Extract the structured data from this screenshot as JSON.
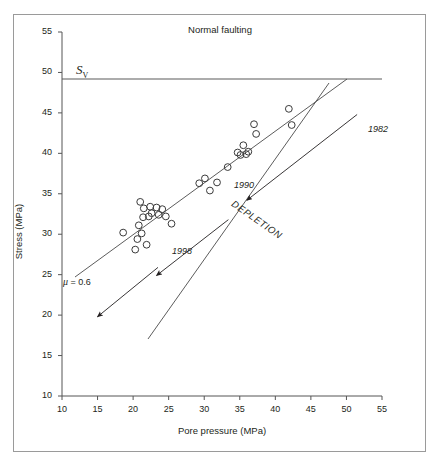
{
  "chart_data": {
    "type": "scatter",
    "title": "Normal faulting",
    "xlabel": "Pore pressure (MPa)",
    "ylabel": "Stress (MPa)",
    "xlim": [
      10,
      55
    ],
    "ylim": [
      10,
      55
    ],
    "xticks": [
      10,
      15,
      20,
      25,
      30,
      35,
      40,
      45,
      50,
      55
    ],
    "yticks": [
      10,
      15,
      20,
      25,
      30,
      35,
      40,
      45,
      50,
      55
    ],
    "grid": false,
    "legend": "none",
    "marker": "open-circle",
    "series": [
      {
        "name": "Stress vs pore pressure",
        "points": [
          [
            18.6,
            30.2
          ],
          [
            20.3,
            28.1
          ],
          [
            20.6,
            29.4
          ],
          [
            20.8,
            31.1
          ],
          [
            21.0,
            34.0
          ],
          [
            21.2,
            30.1
          ],
          [
            21.4,
            32.1
          ],
          [
            21.5,
            33.2
          ],
          [
            21.9,
            28.7
          ],
          [
            22.2,
            32.2
          ],
          [
            22.4,
            33.4
          ],
          [
            22.6,
            32.6
          ],
          [
            23.3,
            33.3
          ],
          [
            23.6,
            32.4
          ],
          [
            24.1,
            33.1
          ],
          [
            24.6,
            32.2
          ],
          [
            25.4,
            31.3
          ],
          [
            29.3,
            36.3
          ],
          [
            30.1,
            36.9
          ],
          [
            30.8,
            35.4
          ],
          [
            31.8,
            36.4
          ],
          [
            33.3,
            38.3
          ],
          [
            34.7,
            40.1
          ],
          [
            35.1,
            39.8
          ],
          [
            35.5,
            41.0
          ],
          [
            35.9,
            39.9
          ],
          [
            36.2,
            40.2
          ],
          [
            37.0,
            43.6
          ],
          [
            37.3,
            42.4
          ],
          [
            41.9,
            45.5
          ],
          [
            42.3,
            43.5
          ]
        ]
      }
    ],
    "reference_lines": [
      {
        "name": "Sv",
        "label": "S_V",
        "orientation": "horizontal",
        "y": 48.8
      },
      {
        "name": "failure-line",
        "label": "mu = 0.6",
        "orientation": "diagonal",
        "from": [
          11.9,
          24.9
        ],
        "to": [
          50.0,
          48.8
        ]
      },
      {
        "name": "depletion-path",
        "label": "DEPLETION",
        "orientation": "diagonal",
        "from": [
          47.5,
          48.3
        ],
        "to": [
          22.0,
          17.0
        ]
      }
    ],
    "annotations": [
      {
        "text": "1982",
        "x": 53.5,
        "y": 42.4,
        "style": "italic"
      },
      {
        "text": "1990",
        "x": 34.6,
        "y": 35.6,
        "style": "italic"
      },
      {
        "text": "1998",
        "x": 25.8,
        "y": 27.4,
        "style": "italic"
      },
      {
        "text": "DEPLETION",
        "x": 34.9,
        "y": 33.4,
        "style": "italic-rotated"
      },
      {
        "text": "μ = 0.6",
        "x": 11.6,
        "y": 23.7,
        "style": "plain"
      },
      {
        "text": "S",
        "sub": "V",
        "x": 12.8,
        "y": 50.5,
        "style": "serif-italic"
      }
    ],
    "arrows": [
      {
        "name": "arrow-1982",
        "from": [
          51.5,
          44.8
        ],
        "to": [
          36.0,
          34.2
        ]
      },
      {
        "name": "arrow-1990",
        "from": [
          33.4,
          31.8
        ],
        "to": [
          23.3,
          24.9
        ]
      },
      {
        "name": "arrow-1998",
        "from": [
          23.5,
          25.9
        ],
        "to": [
          15.0,
          19.8
        ]
      }
    ]
  },
  "chart": {
    "title": "Normal faulting",
    "x_axis_title": "Pore pressure (MPa)",
    "y_axis_title": "Stress (MPa)",
    "sv_symbol": "S",
    "sv_subscript": "V",
    "mu_symbol": "μ",
    "mu_value": "= 0.6",
    "depletion_text": "DEPLETION",
    "years": {
      "y1982": "1982",
      "y1990": "1990",
      "y1998": "1998"
    },
    "x_tick_labels": [
      "10",
      "15",
      "20",
      "25",
      "30",
      "35",
      "40",
      "45",
      "50",
      "55"
    ],
    "y_tick_labels": [
      "10",
      "15",
      "20",
      "25",
      "30",
      "35",
      "40",
      "45",
      "50",
      "55"
    ]
  },
  "colors": {
    "ink": "#231f20",
    "axis": "#555555",
    "frame": "#9a9a9a",
    "marker_stroke": "#3a3a3a",
    "line": "#4a4a4a"
  }
}
